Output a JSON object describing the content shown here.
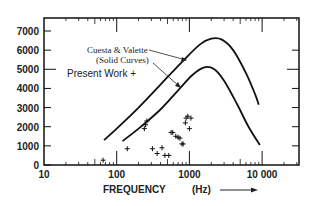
{
  "chart_data": {
    "type": "line",
    "title": "",
    "xlabel": "FREQUENCY",
    "xunit": "(Hz)",
    "ylabel": "",
    "xscale": "log",
    "xlim": [
      10,
      40000
    ],
    "ylim": [
      0,
      7000
    ],
    "x_ticks": [
      10,
      100,
      1000,
      10000
    ],
    "x_tick_labels": [
      "10",
      "100",
      "1000",
      "10 000"
    ],
    "y_ticks": [
      0,
      1000,
      2000,
      3000,
      4000,
      5000,
      6000,
      7000
    ],
    "y_tick_labels": [
      "0",
      "1000",
      "2000",
      "3000",
      "4000",
      "5000",
      "6000",
      "7000"
    ],
    "grid": false,
    "annotations": {
      "curves_label_1": "Cuesta & Valette",
      "curves_label_2": "(Solid Curves)",
      "points_label": "Present Work  +"
    },
    "series": [
      {
        "name": "Cuesta & Valette upper curve",
        "kind": "line",
        "points": [
          [
            67,
            1300
          ],
          [
            100,
            1900
          ],
          [
            200,
            3000
          ],
          [
            400,
            4200
          ],
          [
            800,
            5400
          ],
          [
            1400,
            6300
          ],
          [
            2000,
            6600
          ],
          [
            2800,
            6550
          ],
          [
            4000,
            6000
          ],
          [
            6000,
            4800
          ],
          [
            8000,
            3700
          ],
          [
            9000,
            3150
          ]
        ]
      },
      {
        "name": "Cuesta & Valette lower curve",
        "kind": "line",
        "points": [
          [
            120,
            1250
          ],
          [
            200,
            1900
          ],
          [
            400,
            2900
          ],
          [
            700,
            3900
          ],
          [
            1100,
            4700
          ],
          [
            1600,
            5100
          ],
          [
            2200,
            5000
          ],
          [
            3000,
            4400
          ],
          [
            4500,
            3200
          ],
          [
            6500,
            2000
          ],
          [
            9300,
            1050
          ]
        ]
      },
      {
        "name": "Present Work",
        "kind": "scatter",
        "marker": "+",
        "points": [
          [
            65,
            250
          ],
          [
            140,
            850
          ],
          [
            240,
            1900
          ],
          [
            260,
            2300
          ],
          [
            250,
            2100
          ],
          [
            310,
            850
          ],
          [
            360,
            600
          ],
          [
            420,
            900
          ],
          [
            460,
            500
          ],
          [
            520,
            500
          ],
          [
            560,
            1700
          ],
          [
            590,
            1700
          ],
          [
            650,
            1500
          ],
          [
            700,
            1450
          ],
          [
            740,
            1400
          ],
          [
            790,
            1100
          ],
          [
            820,
            1100
          ],
          [
            880,
            2200
          ],
          [
            900,
            2450
          ],
          [
            950,
            2550
          ],
          [
            1050,
            2450
          ],
          [
            1000,
            1900
          ]
        ]
      }
    ]
  }
}
